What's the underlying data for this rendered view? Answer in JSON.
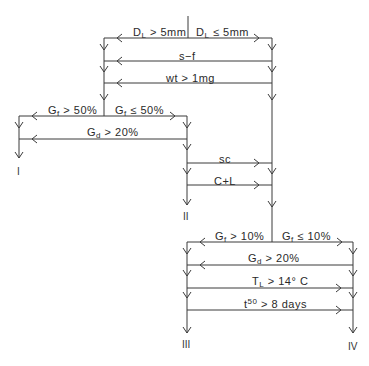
{
  "diagram": {
    "type": "decision-key-flowchart",
    "line_color": "#3a3a3a",
    "text_color": "#2a2a2a",
    "splits": [
      {
        "id": "s1",
        "left": {
          "var": "D",
          "sub": "L",
          "rest": " > 5mm"
        },
        "right": {
          "var": "D",
          "sub": "L",
          "rest": " ≤ 5mm"
        }
      },
      {
        "id": "s2",
        "left": {
          "var": "G",
          "sub": "f",
          "rest": " > 50%"
        },
        "right": {
          "var": "G",
          "sub": "f",
          "rest": " ≤ 50%"
        }
      },
      {
        "id": "s3",
        "left": {
          "var": "G",
          "sub": "f",
          "rest": " > 10%"
        },
        "right": {
          "var": "G",
          "sub": "f",
          "rest": " ≤ 10%"
        }
      }
    ],
    "criteria": [
      {
        "id": "c1",
        "text": "s−f",
        "direction": "left"
      },
      {
        "id": "c2",
        "text": "wt  >  1mg",
        "direction": "left"
      },
      {
        "id": "c3",
        "var": "G",
        "sub": "d",
        "rest": " > 20%",
        "direction": "left"
      },
      {
        "id": "c4",
        "text": "sc",
        "direction": "right"
      },
      {
        "id": "c5",
        "text": "C+L",
        "direction": "right"
      },
      {
        "id": "c6",
        "var": "G",
        "sub": "d",
        "rest": "  >  20%",
        "direction": "left"
      },
      {
        "id": "c7",
        "var": "T",
        "sub": "L",
        "rest": "  >  14° C",
        "direction": "right"
      },
      {
        "id": "c8",
        "var": "t",
        "sup": "50",
        "rest": "  >  8  days",
        "direction": "right"
      }
    ],
    "terminals": [
      "I",
      "II",
      "III",
      "IV"
    ]
  }
}
